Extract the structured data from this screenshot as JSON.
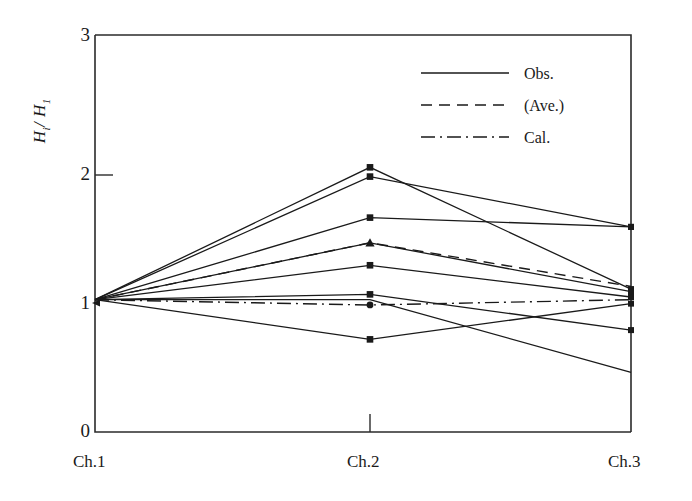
{
  "chart_data": {
    "type": "line",
    "title": "",
    "xlabel": "",
    "ylabel": "Hi / H1",
    "categories": [
      "Ch.1",
      "Ch.2",
      "Ch.3"
    ],
    "x_tick_labels": [
      "Ch.1",
      "Ch.2",
      "Ch.3"
    ],
    "y_tick_labels": [
      "0",
      "1",
      "2",
      "3"
    ],
    "y_ticks": [
      0,
      1,
      2,
      3
    ],
    "ylim": [
      0,
      3
    ],
    "grid": false,
    "legend_position": "upper right",
    "legend": [
      {
        "label": "Obs.",
        "style": "solid"
      },
      {
        "label": "(Ave.)",
        "style": "dashed"
      },
      {
        "label": "Cal.",
        "style": "dashdot"
      }
    ],
    "series": [
      {
        "name": "Obs. 1",
        "style": "solid",
        "marker": "square",
        "values": [
          1.0,
          2.0,
          1.08
        ]
      },
      {
        "name": "Obs. 2",
        "style": "solid",
        "marker": "square",
        "values": [
          1.0,
          1.93,
          1.55
        ]
      },
      {
        "name": "Obs. 3",
        "style": "solid",
        "marker": "square",
        "values": [
          1.0,
          1.62,
          1.55
        ]
      },
      {
        "name": "Obs. 4",
        "style": "solid",
        "marker": "triangle",
        "values": [
          1.0,
          1.43,
          1.06
        ]
      },
      {
        "name": "Obs. 5",
        "style": "solid",
        "marker": "square",
        "values": [
          1.0,
          1.26,
          1.02
        ]
      },
      {
        "name": "Obs. 6",
        "style": "solid",
        "marker": "square",
        "values": [
          1.0,
          1.04,
          0.77
        ]
      },
      {
        "name": "Obs. 7",
        "style": "solid",
        "marker": "square",
        "values": [
          1.0,
          0.7,
          0.97
        ]
      },
      {
        "name": "Obs. 8",
        "style": "solid",
        "marker": "none",
        "values": [
          1.0,
          1.0,
          0.45
        ]
      },
      {
        "name": "(Ave.)",
        "style": "dashed",
        "marker": "none",
        "values": [
          1.0,
          1.43,
          1.1
        ]
      },
      {
        "name": "Cal.",
        "style": "dashdot",
        "marker": "circle",
        "values": [
          1.0,
          0.96,
          1.0
        ]
      }
    ]
  },
  "axis": {
    "y_label_main": "H",
    "y_label_sub_i": "i",
    "y_label_slash": "/ H",
    "y_label_sub_1": "1"
  },
  "colors": {
    "line": "#1a1a1a",
    "axis": "#2b2b2b",
    "background": "#ffffff"
  }
}
